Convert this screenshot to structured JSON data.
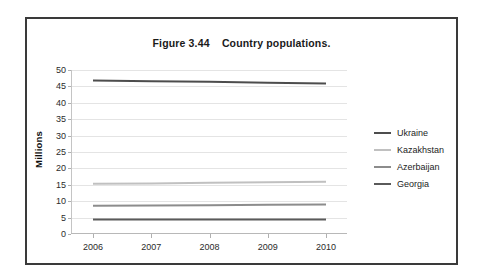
{
  "figure": {
    "title": "Figure 3.44    Country populations."
  },
  "chart_data": {
    "type": "line",
    "title": "Figure 3.44    Country populations.",
    "xlabel": "",
    "ylabel": "Millions",
    "x": [
      2006,
      2007,
      2008,
      2009,
      2010
    ],
    "xtick_labels": [
      "2006",
      "2007",
      "2008",
      "2009",
      "2010"
    ],
    "ytick_labels": [
      "0",
      "5",
      "10",
      "15",
      "20",
      "25",
      "30",
      "35",
      "40",
      "45",
      "50"
    ],
    "ytick_values": [
      0,
      5,
      10,
      15,
      20,
      25,
      30,
      35,
      40,
      45,
      50
    ],
    "ylim": [
      0,
      50
    ],
    "grid": true,
    "legend_position": "right",
    "series": [
      {
        "name": "Ukraine",
        "color": "#4d4d4d",
        "values": [
          46.8,
          46.6,
          46.4,
          46.1,
          45.9
        ]
      },
      {
        "name": "Kazakhstan",
        "color": "#c0c0c0",
        "values": [
          15.3,
          15.4,
          15.6,
          15.8,
          15.9
        ]
      },
      {
        "name": "Azerbaijan",
        "color": "#8c8c8c",
        "values": [
          8.6,
          8.7,
          8.8,
          8.9,
          9.0
        ]
      },
      {
        "name": "Georgia",
        "color": "#5a5a5a",
        "values": [
          4.4,
          4.4,
          4.4,
          4.4,
          4.4
        ]
      }
    ]
  },
  "legend": {
    "items": [
      {
        "label": "Ukraine"
      },
      {
        "label": "Kazakhstan"
      },
      {
        "label": "Azerbaijan"
      },
      {
        "label": "Georgia"
      }
    ]
  }
}
